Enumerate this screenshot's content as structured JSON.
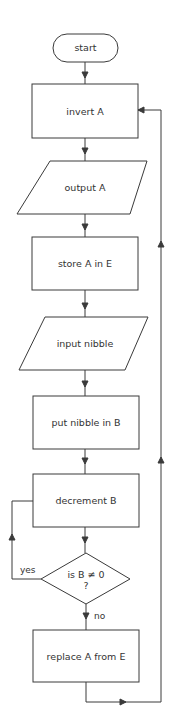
{
  "flowchart": {
    "nodes": [
      {
        "id": "start",
        "shape": "terminal",
        "label": "start"
      },
      {
        "id": "invert",
        "shape": "process",
        "label": "invert A"
      },
      {
        "id": "output",
        "shape": "io",
        "label": "output A"
      },
      {
        "id": "store",
        "shape": "process",
        "label": "store A in E"
      },
      {
        "id": "input",
        "shape": "io",
        "label": "input nibble"
      },
      {
        "id": "put",
        "shape": "process",
        "label": "put nibble in B"
      },
      {
        "id": "decrement",
        "shape": "process",
        "label": "decrement B"
      },
      {
        "id": "decision",
        "shape": "decision",
        "label_line1": "is B ≠ 0",
        "label_line2": "?"
      },
      {
        "id": "replace",
        "shape": "process",
        "label": "replace A from E"
      }
    ],
    "edges": {
      "yes_label": "yes",
      "no_label": "no"
    },
    "colors": {
      "stroke": "#3a3a3a",
      "text": "#333333",
      "background": "#ffffff"
    }
  }
}
